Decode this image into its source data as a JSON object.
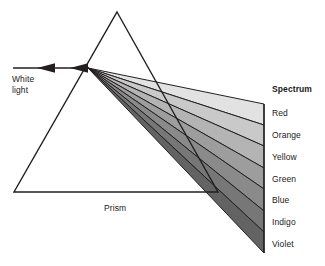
{
  "diagram": {
    "background_color": "#ffffff",
    "stroke_color": "#231f20",
    "text_color": "#1a1a1a"
  },
  "source_beam": {
    "label_line1": "White",
    "label_line2": "light",
    "arrow_name": "white-light-arrow",
    "start_x": 13,
    "end_x": 88,
    "y": 68
  },
  "prism": {
    "label": "Prism",
    "apex_x": 117,
    "apex_y": 12,
    "left_x": 14,
    "right_x": 218,
    "base_y": 192
  },
  "spectrum": {
    "heading": "Spectrum",
    "origin_x": 88,
    "origin_y": 68,
    "screen_x": 264,
    "screen_top_y": 104,
    "screen_bottom_y": 253,
    "bands": [
      {
        "name": "Red",
        "label": "Red",
        "fill": "#e2e2e2",
        "label_y": 112,
        "top_y": 104,
        "bottom_y": 125
      },
      {
        "name": "Orange",
        "label": "Orange",
        "fill": "#c9c9c9",
        "label_y": 134,
        "top_y": 125,
        "bottom_y": 146
      },
      {
        "name": "Yellow",
        "label": "Yellow",
        "fill": "#b4b4b4",
        "label_y": 156,
        "top_y": 146,
        "bottom_y": 168
      },
      {
        "name": "Green",
        "label": "Green",
        "fill": "#9d9d9d",
        "label_y": 178,
        "top_y": 168,
        "bottom_y": 189
      },
      {
        "name": "Blue",
        "label": "Blue",
        "fill": "#8a8a8a",
        "label_y": 199,
        "top_y": 189,
        "bottom_y": 211
      },
      {
        "name": "Indigo",
        "label": "Indigo",
        "fill": "#777777",
        "label_y": 221,
        "top_y": 211,
        "bottom_y": 232
      },
      {
        "name": "Violet",
        "label": "Violet",
        "fill": "#636363",
        "label_y": 243,
        "top_y": 232,
        "bottom_y": 253
      }
    ],
    "heading_y": 88
  }
}
